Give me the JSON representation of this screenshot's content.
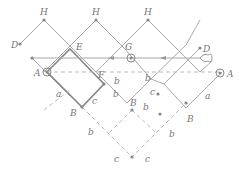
{
  "diagram": {
    "labels": {
      "H1": "H",
      "H2": "H",
      "H3": "H",
      "D_left": "D",
      "D_right": "D",
      "E": "E",
      "G": "G",
      "F": "F",
      "A_left": "A",
      "A_right": "A",
      "B1": "B",
      "B2": "B",
      "B3": "B",
      "a1": "a",
      "a2": "a",
      "b1": "b",
      "b2": "b",
      "b3": "b",
      "b4": "b",
      "b5": "b",
      "b6": "b",
      "c1": "c",
      "c2": "c",
      "c3": "c",
      "c4": "c"
    },
    "colors": {
      "line": "#aaaaaa",
      "bold": "#888888",
      "dashed": "#bbbbbb",
      "text": "#777777"
    }
  }
}
